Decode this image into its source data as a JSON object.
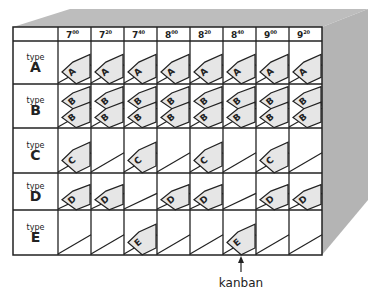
{
  "diagram": {
    "colors": {
      "box_side": "#b4b4b4",
      "box_top": "#bdbdbd",
      "grid_line": "#222222",
      "card_fill": "#e6e6e6",
      "card_stroke": "#222222",
      "text": "#222222"
    },
    "time_slots": [
      {
        "hour": "7",
        "min": "00"
      },
      {
        "hour": "7",
        "min": "20"
      },
      {
        "hour": "7",
        "min": "40"
      },
      {
        "hour": "8",
        "min": "00"
      },
      {
        "hour": "8",
        "min": "20"
      },
      {
        "hour": "8",
        "min": "40"
      },
      {
        "hour": "9",
        "min": "00"
      },
      {
        "hour": "9",
        "min": "20"
      }
    ],
    "rows": [
      {
        "label_small": "type",
        "label_big": "A",
        "letter": "A",
        "double": false,
        "cards": [
          1,
          1,
          1,
          1,
          1,
          1,
          1,
          1
        ]
      },
      {
        "label_small": "type",
        "label_big": "B",
        "letter": "B",
        "double": true,
        "cards": [
          1,
          1,
          1,
          1,
          1,
          1,
          1,
          1
        ]
      },
      {
        "label_small": "type",
        "label_big": "C",
        "letter": "C",
        "double": false,
        "cards": [
          1,
          0,
          1,
          0,
          1,
          0,
          1,
          0
        ]
      },
      {
        "label_small": "type",
        "label_big": "D",
        "letter": "D",
        "double": false,
        "cards": [
          1,
          1,
          0,
          1,
          1,
          0,
          1,
          1
        ]
      },
      {
        "label_small": "type",
        "label_big": "E",
        "letter": "E",
        "double": false,
        "cards": [
          0,
          0,
          1,
          0,
          0,
          1,
          0,
          0
        ]
      }
    ],
    "annotation": {
      "label": "kanban",
      "points_to_column": 5,
      "points_to_row": 4
    }
  }
}
